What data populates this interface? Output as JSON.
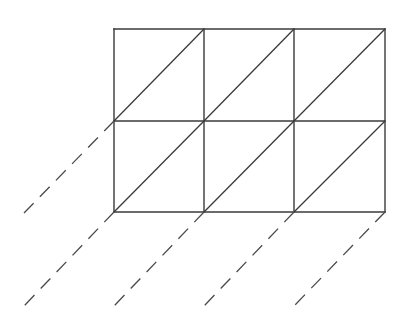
{
  "diagram": {
    "grid": {
      "columns": 3,
      "rows": 2,
      "x": [
        114,
        204,
        294,
        385
      ],
      "y": [
        29,
        121,
        212
      ]
    },
    "dashed_lines": [
      {
        "from": [
          114,
          121
        ],
        "to": [
          24,
          213
        ]
      },
      {
        "from": [
          114,
          212
        ],
        "to": [
          24,
          306
        ]
      },
      {
        "from": [
          204,
          212
        ],
        "to": [
          114,
          306
        ]
      },
      {
        "from": [
          294,
          212
        ],
        "to": [
          204,
          306
        ]
      },
      {
        "from": [
          385,
          212
        ],
        "to": [
          294,
          306
        ]
      }
    ],
    "colors": {
      "line": "#3a3a3a",
      "dashed": "#4a4a4a",
      "background": "#ffffff"
    }
  }
}
